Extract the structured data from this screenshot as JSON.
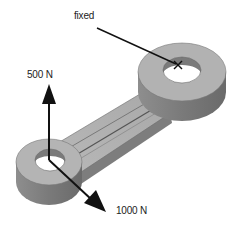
{
  "diagram": {
    "labels": {
      "fixed": "fixed",
      "force_vertical": "500 N",
      "force_diagonal": "1000 N"
    },
    "markers": {
      "fixed_marker": "X"
    },
    "colors": {
      "part_top": "#b4b4b4",
      "part_side": "#8a8a8a",
      "part_dark": "#6e6e6e",
      "arrow": "#111111",
      "background": "#ffffff"
    }
  }
}
